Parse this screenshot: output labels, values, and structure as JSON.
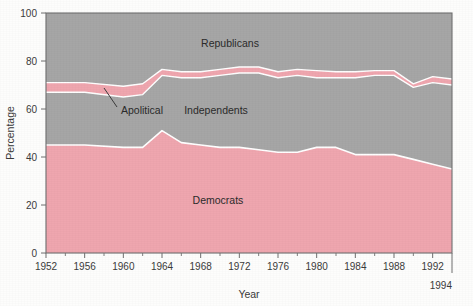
{
  "figure": {
    "background_color": "#fdfdfc",
    "plot_frame_color": "#6f6f6f"
  },
  "axes": {
    "x_title": "Year",
    "y_title": "Percentage",
    "x_ticks": [
      "1952",
      "1956",
      "1960",
      "1964",
      "1968",
      "1972",
      "1976",
      "1980",
      "1984",
      "1988",
      "1992"
    ],
    "x_end_label": "1994",
    "y_ticks": [
      "0",
      "20",
      "40",
      "60",
      "80",
      "100"
    ]
  },
  "series_labels": {
    "republicans": "Republicans",
    "independents": "Independents",
    "democrats": "Democrats",
    "apolitical": "Apolitical"
  },
  "annotation": {
    "label": "Apolitical"
  },
  "colors": {
    "democrat_fill": "#efa6af",
    "independent_fill": "#a6a6a6",
    "apolitical_fill": "#efa6af",
    "republican_fill": "#a6a6a6",
    "boundary_line": "#ffffff",
    "axis": "#6f6f6f",
    "text": "#2b2b2b"
  },
  "chart_data": {
    "type": "area",
    "title": "",
    "subtitle": "",
    "xlabel": "Year",
    "ylabel": "Percentage",
    "xlim": [
      1952,
      1994
    ],
    "ylim": [
      0,
      100
    ],
    "grid": false,
    "legend_position": "inline-labels",
    "stacked": true,
    "stack_total": 100,
    "annotations": [
      {
        "text": "Apolitical",
        "points_to_year": 1959,
        "points_to_value": 68,
        "label_year": 1961,
        "label_value": 60
      }
    ],
    "x": [
      1952,
      1956,
      1960,
      1962,
      1964,
      1966,
      1968,
      1970,
      1972,
      1974,
      1976,
      1978,
      1980,
      1982,
      1984,
      1986,
      1988,
      1990,
      1992,
      1994
    ],
    "series": [
      {
        "name": "Democrats",
        "color": "#efa6af",
        "values": [
          45,
          45,
          44,
          44,
          51,
          46,
          45,
          44,
          44,
          43,
          42,
          42,
          44,
          44,
          41,
          41,
          41,
          39,
          37,
          35
        ]
      },
      {
        "name": "Independents",
        "color": "#a6a6a6",
        "values": [
          22,
          22,
          21,
          22,
          23,
          27,
          28,
          30,
          31,
          32,
          31,
          32,
          29,
          29,
          32,
          33,
          33,
          30,
          34,
          35
        ]
      },
      {
        "name": "Apolitical",
        "color": "#efa6af",
        "values": [
          4,
          4,
          4.5,
          4.5,
          2.5,
          2.5,
          2.5,
          2.5,
          2.5,
          2.5,
          2.5,
          2.5,
          3,
          2.5,
          2.5,
          2,
          2,
          1.5,
          2.5,
          2.5
        ]
      },
      {
        "name": "Republicans",
        "color": "#a6a6a6",
        "values": [
          29,
          29,
          30.5,
          29.5,
          23.5,
          24.5,
          24.5,
          23.5,
          22.5,
          22.5,
          24.5,
          23.5,
          24,
          24.5,
          24.5,
          24,
          24,
          29.5,
          26.5,
          27.5
        ]
      }
    ],
    "cumulative_boundaries": {
      "note": "percent-of-total, cumulative from bottom of stack",
      "democrats_top": [
        45,
        45,
        44,
        44,
        51,
        46,
        45,
        44,
        44,
        43,
        42,
        42,
        44,
        44,
        41,
        41,
        41,
        39,
        37,
        35
      ],
      "independents_top": [
        67,
        67,
        65,
        66,
        74,
        73,
        73,
        74,
        75,
        75,
        73,
        74,
        73,
        73,
        73,
        74,
        74,
        69,
        71,
        70
      ],
      "apolitical_top": [
        71,
        71,
        69.5,
        70.5,
        76.5,
        75.5,
        75.5,
        76.5,
        77.5,
        77.5,
        75.5,
        76.5,
        76,
        75.5,
        75.5,
        76,
        76,
        70.5,
        73.5,
        72.5
      ]
    }
  }
}
